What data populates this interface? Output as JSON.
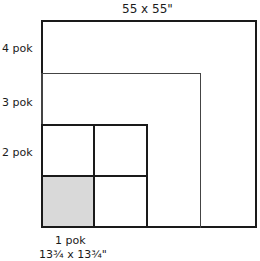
{
  "title": "55 x 55\"",
  "labels": {
    "four": "4 pok",
    "three": "3 pok",
    "two": "2 pok",
    "one": "1 pok",
    "one_size": "13¾ x 13¾\""
  },
  "colors": {
    "stroke": "#1a1a1a",
    "shaded": "#d9d9d9",
    "background": "#ffffff"
  }
}
